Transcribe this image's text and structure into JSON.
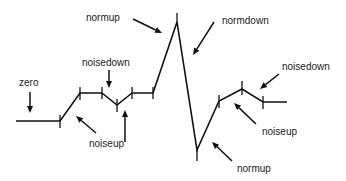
{
  "diagram": {
    "title": "",
    "colors": {
      "line": "#111111",
      "text": "#222222",
      "background": "#ffffff"
    },
    "waveform": {
      "points": [
        [
          16,
          121
        ],
        [
          60,
          121
        ],
        [
          80,
          93
        ],
        [
          102,
          93
        ],
        [
          117,
          105
        ],
        [
          132,
          93
        ],
        [
          153,
          93
        ],
        [
          177,
          22
        ],
        [
          197,
          150
        ],
        [
          219,
          101
        ],
        [
          242,
          89
        ],
        [
          263,
          102
        ],
        [
          287,
          102
        ]
      ],
      "ticks": [
        {
          "x": 60,
          "y1": 115,
          "y2": 128
        },
        {
          "x": 80,
          "y1": 87,
          "y2": 100
        },
        {
          "x": 102,
          "y1": 87,
          "y2": 99
        },
        {
          "x": 117,
          "y1": 99,
          "y2": 112
        },
        {
          "x": 132,
          "y1": 87,
          "y2": 99
        },
        {
          "x": 153,
          "y1": 87,
          "y2": 99
        },
        {
          "x": 177,
          "y1": 13,
          "y2": 24
        },
        {
          "x": 197,
          "y1": 148,
          "y2": 161
        },
        {
          "x": 219,
          "y1": 95,
          "y2": 108
        },
        {
          "x": 242,
          "y1": 81,
          "y2": 95
        },
        {
          "x": 263,
          "y1": 96,
          "y2": 109
        }
      ]
    },
    "labels": [
      {
        "id": "normup-top",
        "text": "normup",
        "x": 86,
        "y": 21
      },
      {
        "id": "normdown",
        "text": "normdown",
        "x": 222,
        "y": 24
      },
      {
        "id": "noisedown-left",
        "text": "noisedown",
        "x": 82,
        "y": 66
      },
      {
        "id": "zero",
        "text": "zero",
        "x": 19,
        "y": 86
      },
      {
        "id": "noiseup-left",
        "text": "noiseup",
        "x": 89,
        "y": 147
      },
      {
        "id": "noisedown-right",
        "text": "noisedown",
        "x": 282,
        "y": 70
      },
      {
        "id": "noiseup-right",
        "text": "noiseup",
        "x": 262,
        "y": 135
      },
      {
        "id": "normup-bottom",
        "text": "normup",
        "x": 237,
        "y": 172
      }
    ],
    "arrows": [
      {
        "id": "arrow-normup-top",
        "x1": 133,
        "y1": 19,
        "x2": 162,
        "y2": 33
      },
      {
        "id": "arrow-normdown",
        "x1": 214,
        "y1": 22,
        "x2": 193,
        "y2": 55
      },
      {
        "id": "arrow-noisedown-left",
        "x1": 109,
        "y1": 70,
        "x2": 109,
        "y2": 88
      },
      {
        "id": "arrow-zero",
        "x1": 30,
        "y1": 92,
        "x2": 30,
        "y2": 113
      },
      {
        "id": "arrow-noiseup-left",
        "x1": 96,
        "y1": 133,
        "x2": 76,
        "y2": 116
      },
      {
        "id": "arrow-noiseup-mid",
        "x1": 125,
        "y1": 142,
        "x2": 125,
        "y2": 110
      },
      {
        "id": "arrow-noisedown-right",
        "x1": 279,
        "y1": 74,
        "x2": 260,
        "y2": 89
      },
      {
        "id": "arrow-noiseup-right",
        "x1": 256,
        "y1": 124,
        "x2": 234,
        "y2": 103
      },
      {
        "id": "arrow-normup-bottom",
        "x1": 232,
        "y1": 161,
        "x2": 212,
        "y2": 142
      }
    ]
  }
}
